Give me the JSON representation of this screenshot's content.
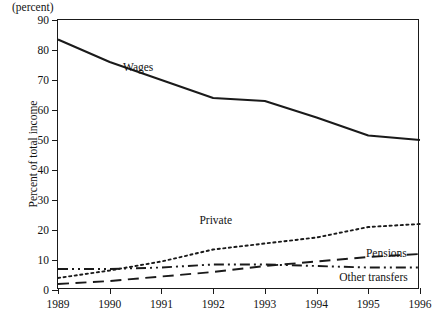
{
  "figure": {
    "unit_note": "(percent)",
    "y_axis_title": "Percent of total income"
  },
  "chart_data": {
    "type": "line",
    "title": "",
    "subtitle": "",
    "xlabel": "",
    "ylabel": "Percent of total income",
    "unit_note": "(percent)",
    "grid": false,
    "legend_position": "inline-annotations",
    "xlim": [
      1989,
      1996
    ],
    "ylim": [
      0,
      90
    ],
    "ytick_step": 10,
    "x": [
      1989,
      1990,
      1991,
      1992,
      1993,
      1994,
      1995,
      1996
    ],
    "categories": [
      "1989",
      "1990",
      "1991",
      "1992",
      "1993",
      "1994",
      "1995",
      "1996"
    ],
    "ytick_labels": [
      "0",
      "10",
      "20",
      "30",
      "40",
      "50",
      "60",
      "70",
      "80",
      "90"
    ],
    "series": [
      {
        "name": "Wages",
        "style": "solid",
        "color": "#1a1a1a",
        "values": [
          83.5,
          76.0,
          70.0,
          64.0,
          63.0,
          57.5,
          51.5,
          50.0
        ],
        "label": "Wages",
        "label_x": 1990.55,
        "label_y": 74.5
      },
      {
        "name": "Private",
        "style": "dotted",
        "color": "#1a1a1a",
        "values": [
          4.0,
          6.5,
          9.5,
          13.5,
          15.5,
          17.5,
          21.0,
          22.0
        ],
        "label": "Private",
        "label_x": 1992.05,
        "label_y": 23.5
      },
      {
        "name": "Pensions",
        "style": "dashed",
        "color": "#1a1a1a",
        "values": [
          2.0,
          3.0,
          4.5,
          6.0,
          8.0,
          9.5,
          11.0,
          12.0
        ],
        "label": "Pensions",
        "label_x": 1995.35,
        "label_y": 12.3
      },
      {
        "name": "Other transfers",
        "style": "dash-dot-dot",
        "color": "#1a1a1a",
        "values": [
          7.0,
          7.0,
          7.5,
          8.5,
          8.5,
          8.0,
          7.5,
          7.5
        ],
        "label": "Other transfers",
        "label_x": 1995.1,
        "label_y": 4.2
      }
    ]
  }
}
